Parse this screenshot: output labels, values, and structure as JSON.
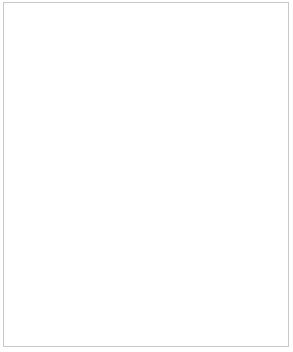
{
  "figure": {
    "border_color": "#c8c8c8",
    "background": "#ffffff",
    "line_color": "#000000",
    "axis_color": "#808080"
  },
  "shared_axis": {
    "xlabel": "Year",
    "xticks": [
      "1960",
      "1980",
      "2000",
      "2020",
      "2040"
    ],
    "xtick_values": [
      1960,
      1980,
      2000,
      2020,
      2040
    ],
    "xlim": [
      1950,
      2050
    ]
  },
  "labels": {
    "total": "Total",
    "urban": "Urban",
    "rural": "Rural"
  },
  "chart_data": [
    {
      "type": "line",
      "title": "",
      "xlabel": "",
      "ylabel": "",
      "xlim": [
        1950,
        2050
      ],
      "ylim": [
        0,
        10
      ],
      "yticks": [
        2,
        4,
        6,
        8,
        10
      ],
      "ytick_labels": [
        "2",
        "4",
        "6",
        "8",
        "10"
      ],
      "xticks": [
        1960,
        1980,
        2000,
        2020,
        2040
      ],
      "xtick_labels": [
        "",
        "",
        "",
        "",
        ""
      ],
      "grid": false,
      "legend_position": "inline-right",
      "x": [
        1950,
        1960,
        1970,
        1980,
        1990,
        2000,
        2010,
        2020,
        2030,
        2040,
        2050
      ],
      "series": [
        {
          "name": "Total",
          "style": "solid",
          "values": [
            2.55,
            3.03,
            3.7,
            4.45,
            5.32,
            6.15,
            6.93,
            7.8,
            8.42,
            8.92,
            9.3
          ]
        },
        {
          "name": "Urban",
          "style": "dashed",
          "values": [
            1.1,
            1.35,
            1.75,
            2.25,
            2.8,
            3.25,
            3.6,
            4.25,
            4.95,
            5.65,
            6.3
          ]
        },
        {
          "name": "Rural",
          "style": "dotted",
          "values": [
            1.85,
            2.0,
            2.25,
            2.55,
            2.9,
            3.2,
            3.52,
            3.72,
            3.62,
            3.3,
            2.95
          ]
        }
      ]
    },
    {
      "type": "line",
      "title": "",
      "xlabel": "Year",
      "ylabel": "",
      "xlim": [
        1950,
        2050
      ],
      "ylim": [
        0,
        0.55
      ],
      "yticks": [
        0.1,
        0.2,
        0.3,
        0.4,
        0.5
      ],
      "ytick_labels": [
        "0,1",
        "0,2",
        "0,3",
        "0,4",
        "0,5"
      ],
      "xticks": [
        1960,
        1980,
        2000,
        2020,
        2040
      ],
      "xtick_labels": [
        "1960",
        "1980",
        "2000",
        "2020",
        "2040"
      ],
      "grid": false,
      "legend_position": "none",
      "x": [
        1960,
        1970,
        1980,
        1990,
        2000,
        2010,
        2020,
        2030,
        2040,
        2050
      ],
      "series": [
        {
          "name": "Ratio",
          "style": "solid",
          "values": [
            0.49,
            0.385,
            0.32,
            0.275,
            0.24,
            0.215,
            0.197,
            0.182,
            0.17,
            0.16
          ]
        }
      ]
    }
  ]
}
